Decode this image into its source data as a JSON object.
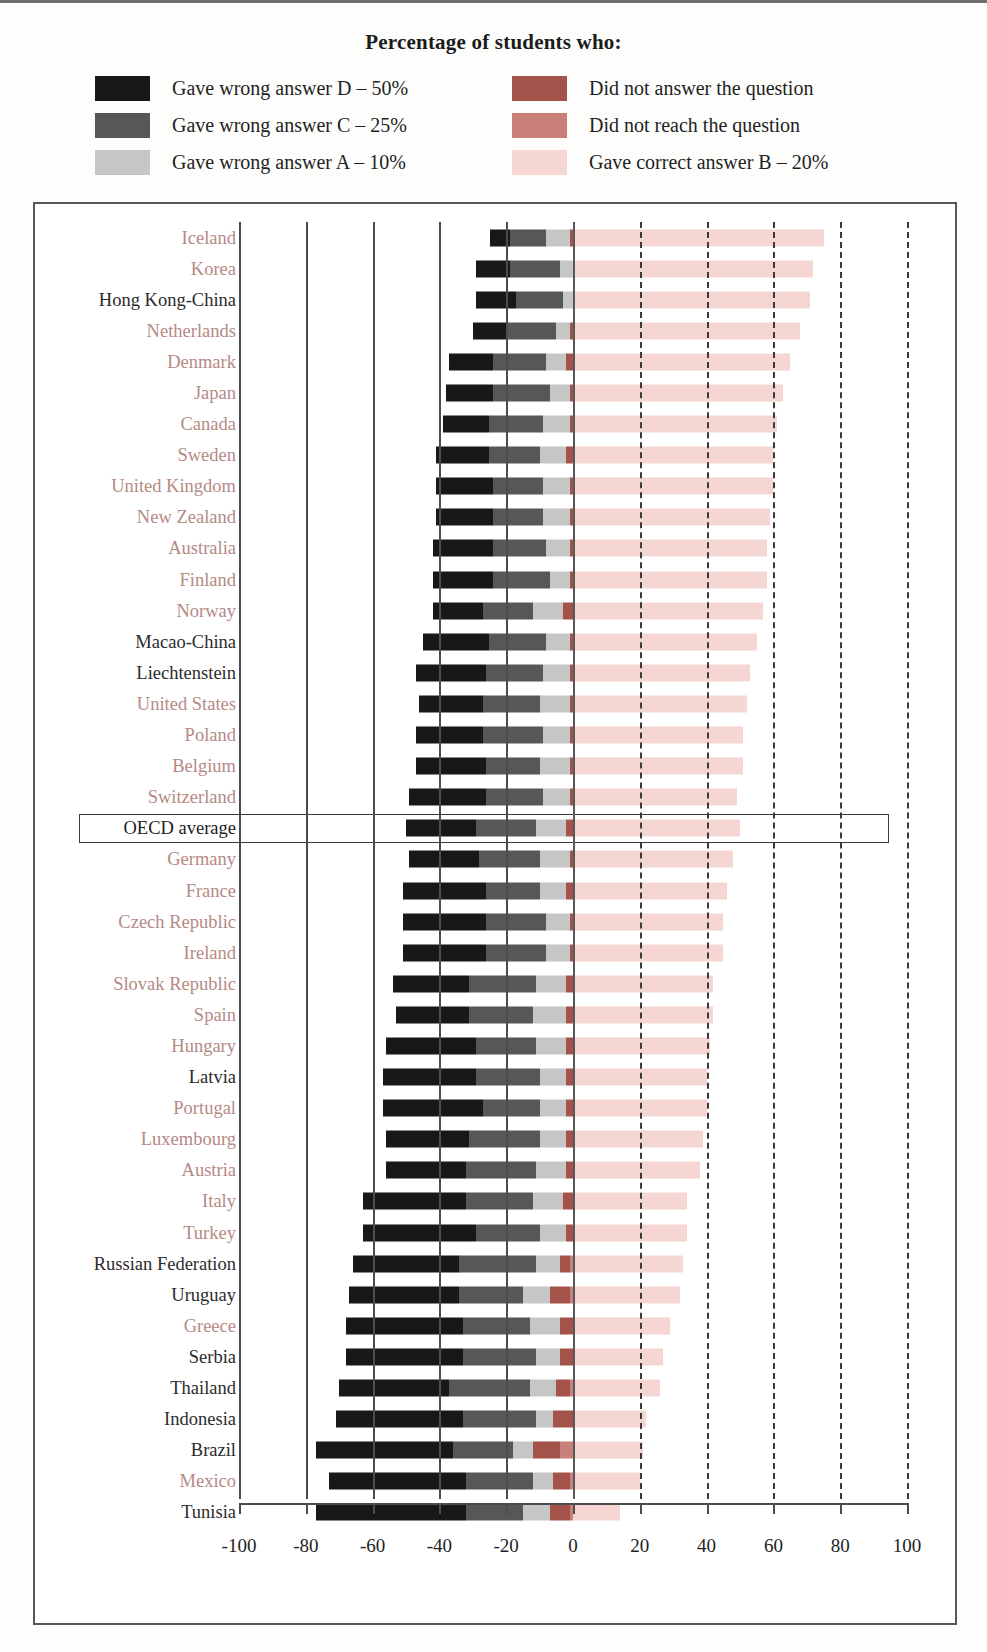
{
  "title": "Percentage of students who:",
  "legend": {
    "left": [
      {
        "label": "Gave wrong answer D – 50%",
        "color": "#1a1718",
        "key": "wrong_d"
      },
      {
        "label": "Gave wrong answer C – 25%",
        "color": "#575757",
        "key": "wrong_c"
      },
      {
        "label": "Gave wrong answer A – 10%",
        "color": "#c6c6c6",
        "key": "wrong_a"
      }
    ],
    "right": [
      {
        "label": "Did not answer the question",
        "color": "#a4534a",
        "key": "no_answer"
      },
      {
        "label": "Did not reach the question",
        "color": "#c98079",
        "key": "not_reached"
      },
      {
        "label": "Gave correct answer B – 20%",
        "color": "#f6d6d2",
        "key": "correct_b"
      }
    ]
  },
  "axis": {
    "ticks": [
      "-100",
      "-80",
      "-60",
      "-40",
      "-20",
      "0",
      "20",
      "40",
      "60",
      "80",
      "100"
    ],
    "min": -100,
    "max": 100,
    "step": 20
  },
  "highlight_row": "OECD average",
  "chart_data": {
    "type": "bar",
    "orientation": "horizontal",
    "stacked": true,
    "diverging": true,
    "title": "Percentage of students who:",
    "xlabel": "",
    "ylabel": "",
    "xlim": [
      -100,
      100
    ],
    "grid": true,
    "legend_position": "top",
    "series": [
      {
        "name": "Gave wrong answer D – 50%",
        "color": "#1a1718",
        "side": "negative"
      },
      {
        "name": "Gave wrong answer C – 25%",
        "color": "#575757",
        "side": "negative"
      },
      {
        "name": "Gave wrong answer A – 10%",
        "color": "#c6c6c6",
        "side": "negative"
      },
      {
        "name": "Did not answer the question",
        "color": "#a4534a",
        "side": "negative"
      },
      {
        "name": "Did not reach the question",
        "color": "#c98079",
        "side": "negative"
      },
      {
        "name": "Gave correct answer B – 20%",
        "color": "#f6d6d2",
        "side": "positive"
      }
    ],
    "categories": [
      "Iceland",
      "Korea",
      "Hong Kong-China",
      "Netherlands",
      "Denmark",
      "Japan",
      "Canada",
      "Sweden",
      "United Kingdom",
      "New Zealand",
      "Australia",
      "Finland",
      "Norway",
      "Macao-China",
      "Liechtenstein",
      "United States",
      "Poland",
      "Belgium",
      "Switzerland",
      "OECD average",
      "Germany",
      "France",
      "Czech Republic",
      "Ireland",
      "Slovak Republic",
      "Spain",
      "Hungary",
      "Latvia",
      "Portugal",
      "Luxembourg",
      "Austria",
      "Italy",
      "Turkey",
      "Russian Federation",
      "Uruguay",
      "Greece",
      "Serbia",
      "Thailand",
      "Indonesia",
      "Brazil",
      "Mexico",
      "Tunisia"
    ],
    "rows": [
      {
        "country": "Iceland",
        "group": "oecd",
        "wrong_d": 6,
        "wrong_c": 11,
        "wrong_a": 7,
        "no_answer": 1,
        "not_reached": 0,
        "correct_b": 75
      },
      {
        "country": "Korea",
        "group": "oecd",
        "wrong_d": 10,
        "wrong_c": 15,
        "wrong_a": 4,
        "no_answer": 0,
        "not_reached": 0,
        "correct_b": 72
      },
      {
        "country": "Hong Kong-China",
        "group": "partner",
        "wrong_d": 12,
        "wrong_c": 14,
        "wrong_a": 3,
        "no_answer": 0,
        "not_reached": 0,
        "correct_b": 71
      },
      {
        "country": "Netherlands",
        "group": "oecd",
        "wrong_d": 10,
        "wrong_c": 15,
        "wrong_a": 4,
        "no_answer": 1,
        "not_reached": 0,
        "correct_b": 68
      },
      {
        "country": "Denmark",
        "group": "oecd",
        "wrong_d": 13,
        "wrong_c": 16,
        "wrong_a": 6,
        "no_answer": 2,
        "not_reached": 0,
        "correct_b": 65
      },
      {
        "country": "Japan",
        "group": "oecd",
        "wrong_d": 14,
        "wrong_c": 17,
        "wrong_a": 6,
        "no_answer": 1,
        "not_reached": 0,
        "correct_b": 63
      },
      {
        "country": "Canada",
        "group": "oecd",
        "wrong_d": 14,
        "wrong_c": 16,
        "wrong_a": 8,
        "no_answer": 1,
        "not_reached": 0,
        "correct_b": 61
      },
      {
        "country": "Sweden",
        "group": "oecd",
        "wrong_d": 16,
        "wrong_c": 15,
        "wrong_a": 8,
        "no_answer": 2,
        "not_reached": 0,
        "correct_b": 60
      },
      {
        "country": "United Kingdom",
        "group": "oecd",
        "wrong_d": 17,
        "wrong_c": 15,
        "wrong_a": 8,
        "no_answer": 1,
        "not_reached": 0,
        "correct_b": 60
      },
      {
        "country": "New Zealand",
        "group": "oecd",
        "wrong_d": 17,
        "wrong_c": 15,
        "wrong_a": 8,
        "no_answer": 1,
        "not_reached": 0,
        "correct_b": 59
      },
      {
        "country": "Australia",
        "group": "oecd",
        "wrong_d": 18,
        "wrong_c": 16,
        "wrong_a": 7,
        "no_answer": 1,
        "not_reached": 0,
        "correct_b": 58
      },
      {
        "country": "Finland",
        "group": "oecd",
        "wrong_d": 18,
        "wrong_c": 17,
        "wrong_a": 6,
        "no_answer": 1,
        "not_reached": 0,
        "correct_b": 58
      },
      {
        "country": "Norway",
        "group": "oecd",
        "wrong_d": 15,
        "wrong_c": 15,
        "wrong_a": 9,
        "no_answer": 3,
        "not_reached": 0,
        "correct_b": 57
      },
      {
        "country": "Macao-China",
        "group": "partner",
        "wrong_d": 20,
        "wrong_c": 17,
        "wrong_a": 7,
        "no_answer": 1,
        "not_reached": 0,
        "correct_b": 55
      },
      {
        "country": "Liechtenstein",
        "group": "partner",
        "wrong_d": 21,
        "wrong_c": 17,
        "wrong_a": 8,
        "no_answer": 1,
        "not_reached": 0,
        "correct_b": 53
      },
      {
        "country": "United States",
        "group": "oecd",
        "wrong_d": 19,
        "wrong_c": 17,
        "wrong_a": 9,
        "no_answer": 1,
        "not_reached": 0,
        "correct_b": 52
      },
      {
        "country": "Poland",
        "group": "oecd",
        "wrong_d": 20,
        "wrong_c": 18,
        "wrong_a": 8,
        "no_answer": 1,
        "not_reached": 0,
        "correct_b": 51
      },
      {
        "country": "Belgium",
        "group": "oecd",
        "wrong_d": 21,
        "wrong_c": 16,
        "wrong_a": 9,
        "no_answer": 1,
        "not_reached": 0,
        "correct_b": 51
      },
      {
        "country": "Switzerland",
        "group": "oecd",
        "wrong_d": 23,
        "wrong_c": 17,
        "wrong_a": 8,
        "no_answer": 1,
        "not_reached": 0,
        "correct_b": 49
      },
      {
        "country": "OECD average",
        "group": "average",
        "wrong_d": 21,
        "wrong_c": 18,
        "wrong_a": 9,
        "no_answer": 2,
        "not_reached": 0,
        "correct_b": 50
      },
      {
        "country": "Germany",
        "group": "oecd",
        "wrong_d": 21,
        "wrong_c": 18,
        "wrong_a": 9,
        "no_answer": 1,
        "not_reached": 0,
        "correct_b": 48
      },
      {
        "country": "France",
        "group": "oecd",
        "wrong_d": 25,
        "wrong_c": 16,
        "wrong_a": 8,
        "no_answer": 2,
        "not_reached": 0,
        "correct_b": 46
      },
      {
        "country": "Czech Republic",
        "group": "oecd",
        "wrong_d": 25,
        "wrong_c": 18,
        "wrong_a": 7,
        "no_answer": 1,
        "not_reached": 0,
        "correct_b": 45
      },
      {
        "country": "Ireland",
        "group": "oecd",
        "wrong_d": 25,
        "wrong_c": 18,
        "wrong_a": 7,
        "no_answer": 1,
        "not_reached": 0,
        "correct_b": 45
      },
      {
        "country": "Slovak Republic",
        "group": "oecd",
        "wrong_d": 23,
        "wrong_c": 20,
        "wrong_a": 9,
        "no_answer": 2,
        "not_reached": 0,
        "correct_b": 42
      },
      {
        "country": "Spain",
        "group": "oecd",
        "wrong_d": 22,
        "wrong_c": 19,
        "wrong_a": 10,
        "no_answer": 2,
        "not_reached": 0,
        "correct_b": 42
      },
      {
        "country": "Hungary",
        "group": "oecd",
        "wrong_d": 27,
        "wrong_c": 18,
        "wrong_a": 9,
        "no_answer": 2,
        "not_reached": 0,
        "correct_b": 41
      },
      {
        "country": "Latvia",
        "group": "partner",
        "wrong_d": 28,
        "wrong_c": 19,
        "wrong_a": 8,
        "no_answer": 2,
        "not_reached": 0,
        "correct_b": 40
      },
      {
        "country": "Portugal",
        "group": "oecd",
        "wrong_d": 30,
        "wrong_c": 17,
        "wrong_a": 8,
        "no_answer": 2,
        "not_reached": 0,
        "correct_b": 40
      },
      {
        "country": "Luxembourg",
        "group": "oecd",
        "wrong_d": 25,
        "wrong_c": 21,
        "wrong_a": 8,
        "no_answer": 2,
        "not_reached": 0,
        "correct_b": 39
      },
      {
        "country": "Austria",
        "group": "oecd",
        "wrong_d": 24,
        "wrong_c": 21,
        "wrong_a": 9,
        "no_answer": 2,
        "not_reached": 0,
        "correct_b": 38
      },
      {
        "country": "Italy",
        "group": "oecd",
        "wrong_d": 31,
        "wrong_c": 20,
        "wrong_a": 9,
        "no_answer": 3,
        "not_reached": 0,
        "correct_b": 34
      },
      {
        "country": "Turkey",
        "group": "oecd",
        "wrong_d": 34,
        "wrong_c": 19,
        "wrong_a": 8,
        "no_answer": 2,
        "not_reached": 0,
        "correct_b": 34
      },
      {
        "country": "Russian Federation",
        "group": "partner",
        "wrong_d": 32,
        "wrong_c": 23,
        "wrong_a": 7,
        "no_answer": 3,
        "not_reached": 1,
        "correct_b": 33
      },
      {
        "country": "Uruguay",
        "group": "partner",
        "wrong_d": 33,
        "wrong_c": 19,
        "wrong_a": 8,
        "no_answer": 6,
        "not_reached": 1,
        "correct_b": 32
      },
      {
        "country": "Greece",
        "group": "oecd",
        "wrong_d": 35,
        "wrong_c": 20,
        "wrong_a": 9,
        "no_answer": 4,
        "not_reached": 0,
        "correct_b": 29
      },
      {
        "country": "Serbia",
        "group": "partner",
        "wrong_d": 35,
        "wrong_c": 22,
        "wrong_a": 7,
        "no_answer": 4,
        "not_reached": 0,
        "correct_b": 27
      },
      {
        "country": "Thailand",
        "group": "partner",
        "wrong_d": 33,
        "wrong_c": 24,
        "wrong_a": 8,
        "no_answer": 4,
        "not_reached": 1,
        "correct_b": 26
      },
      {
        "country": "Indonesia",
        "group": "partner",
        "wrong_d": 38,
        "wrong_c": 22,
        "wrong_a": 5,
        "no_answer": 6,
        "not_reached": 0,
        "correct_b": 22
      },
      {
        "country": "Brazil",
        "group": "partner",
        "wrong_d": 41,
        "wrong_c": 18,
        "wrong_a": 6,
        "no_answer": 8,
        "not_reached": 4,
        "correct_b": 21
      },
      {
        "country": "Mexico",
        "group": "oecd",
        "wrong_d": 41,
        "wrong_c": 20,
        "wrong_a": 6,
        "no_answer": 5,
        "not_reached": 1,
        "correct_b": 20
      },
      {
        "country": "Tunisia",
        "group": "partner",
        "wrong_d": 45,
        "wrong_c": 17,
        "wrong_a": 8,
        "no_answer": 6,
        "not_reached": 1,
        "correct_b": 14
      }
    ]
  }
}
